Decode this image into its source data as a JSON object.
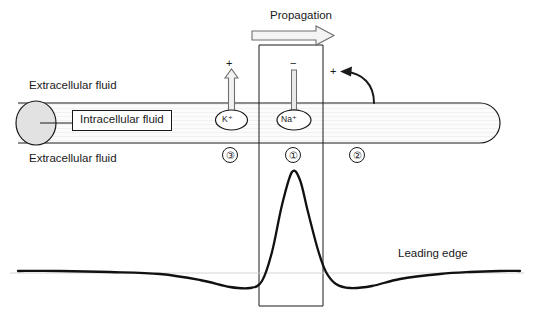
{
  "figure": {
    "type": "diagram",
    "labels": {
      "extracellular_top": "Extracellular fluid",
      "extracellular_bottom": "Extracellular fluid",
      "intracellular": "Intracellular fluid",
      "propagation": "Propagation",
      "leading_edge": "Leading edge"
    },
    "channels": [
      {
        "id": "potassium",
        "ion": "K",
        "charge": "+",
        "ion_label": "K⁺",
        "sign": "+",
        "direction": "out",
        "arrow": "hollow-up-arrow",
        "region_number": "③"
      },
      {
        "id": "sodium",
        "ion": "Na",
        "charge": "+",
        "ion_label": "Na⁺",
        "sign": "−",
        "direction": "in",
        "arrow": "thin-down-arrow",
        "region_number": "①"
      }
    ],
    "current_loop": {
      "sign": "+",
      "arrow": "curved-left-arrow",
      "region_number": "②"
    },
    "region_numbers": [
      "③",
      "①",
      "②"
    ],
    "colors": {
      "stroke": "#1a1a1a",
      "thin_stroke": "#555555",
      "axon_fill": "#fbfbfb",
      "soma_fill": "#e2e2e2",
      "hollow_arrow_fill": "#f2f2f2",
      "background": "#ffffff"
    }
  },
  "chart_data": {
    "type": "line",
    "title": "",
    "xlabel": "",
    "ylabel": "",
    "annotations": [
      "Leading edge"
    ],
    "baseline_y": 273,
    "series": [
      {
        "name": "membrane potential trace",
        "points": [
          [
            18,
            271
          ],
          [
            60,
            271
          ],
          [
            110,
            272
          ],
          [
            160,
            274
          ],
          [
            200,
            280
          ],
          [
            230,
            287
          ],
          [
            250,
            288
          ],
          [
            262,
            281
          ],
          [
            272,
            252
          ],
          [
            282,
            205
          ],
          [
            292,
            172
          ],
          [
            300,
            180
          ],
          [
            308,
            212
          ],
          [
            318,
            250
          ],
          [
            326,
            272
          ],
          [
            336,
            284
          ],
          [
            350,
            288
          ],
          [
            372,
            286
          ],
          [
            400,
            279
          ],
          [
            440,
            274
          ],
          [
            470,
            272
          ],
          [
            500,
            271
          ],
          [
            520,
            271
          ]
        ]
      }
    ]
  }
}
